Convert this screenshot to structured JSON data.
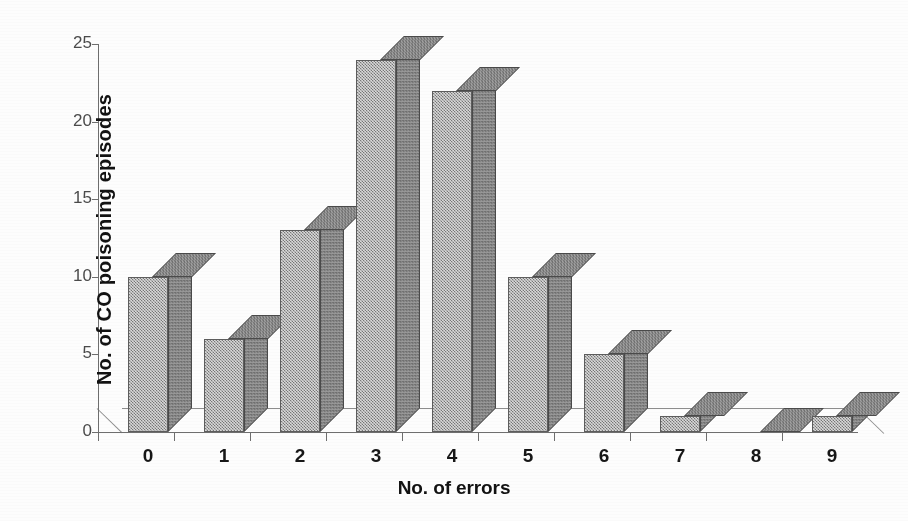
{
  "chart_data": {
    "type": "bar",
    "title": "",
    "subtitle": "",
    "xlabel": "No. of errors",
    "ylabel": "No. of CO poisoning episodes",
    "categories": [
      "0",
      "1",
      "2",
      "3",
      "4",
      "5",
      "6",
      "7",
      "8",
      "9"
    ],
    "values": [
      10,
      6,
      13,
      24,
      22,
      10,
      5,
      1,
      0,
      1
    ],
    "series": [
      {
        "name": "No. of CO poisoning episodes",
        "values": [
          10,
          6,
          13,
          24,
          22,
          10,
          5,
          1,
          0,
          1
        ]
      }
    ],
    "ylim": [
      0,
      25
    ],
    "yticks": [
      0,
      5,
      10,
      15,
      20,
      25
    ],
    "ytick_labels": [
      "0",
      "5",
      "10",
      "15",
      "20",
      "25"
    ],
    "xticks": [
      0,
      1,
      2,
      3,
      4,
      5,
      6,
      7,
      8,
      9
    ],
    "xtick_labels": [
      "0",
      "1",
      "2",
      "3",
      "4",
      "5",
      "6",
      "7",
      "8",
      "9"
    ],
    "grid": false,
    "legend": false,
    "legend_position": "none",
    "style": "3d-column",
    "annotations": [],
    "colors": {
      "bar_front": "#a8a8a8",
      "bar_side": "#7d7d7d",
      "bar_top": "#8e8e8e",
      "bar_outline": "#5d5d5d",
      "axis": "#6e6e6e",
      "text": "#121212",
      "tick_text": "#4b4b4b",
      "background": "#fdfdfd"
    }
  },
  "axes": {
    "y_title": "No. of CO poisoning episodes",
    "x_title": "No. of errors"
  }
}
